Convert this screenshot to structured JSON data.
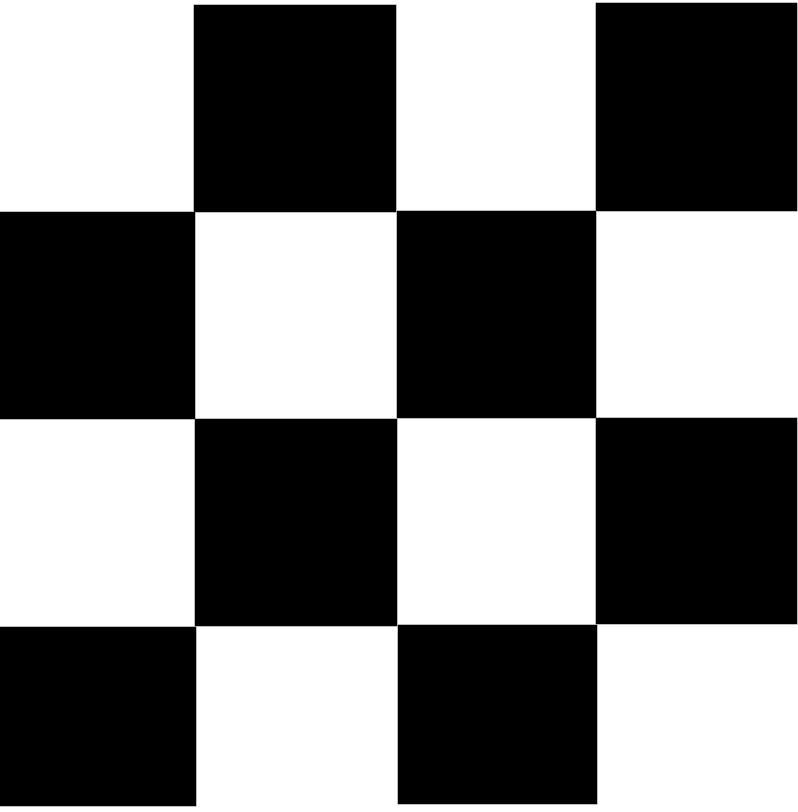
{
  "board": {
    "rows": 4,
    "cols": 4,
    "colors": {
      "dark": "#000000",
      "light": "#ffffff",
      "edge": "#7a7a7a"
    },
    "pattern": [
      [
        "light",
        "dark",
        "light",
        "dark"
      ],
      [
        "dark",
        "light",
        "dark",
        "light"
      ],
      [
        "light",
        "dark",
        "light",
        "dark"
      ],
      [
        "dark",
        "light",
        "dark",
        "light"
      ]
    ],
    "cells": [
      {
        "row": 0,
        "col": 1,
        "x": 194,
        "y": 5,
        "w": 202,
        "h": 207
      },
      {
        "row": 0,
        "col": 3,
        "x": 596,
        "y": 3,
        "w": 201,
        "h": 208
      },
      {
        "row": 1,
        "col": 0,
        "x": 0,
        "y": 212,
        "w": 195,
        "h": 207
      },
      {
        "row": 1,
        "col": 2,
        "x": 397,
        "y": 211,
        "w": 199,
        "h": 207
      },
      {
        "row": 2,
        "col": 1,
        "x": 195,
        "y": 419,
        "w": 202,
        "h": 207
      },
      {
        "row": 2,
        "col": 3,
        "x": 596,
        "y": 418,
        "w": 201,
        "h": 206
      },
      {
        "row": 3,
        "col": 0,
        "x": 0,
        "y": 627,
        "w": 196,
        "h": 179
      },
      {
        "row": 3,
        "col": 2,
        "x": 398,
        "y": 625,
        "w": 199,
        "h": 179
      }
    ]
  }
}
